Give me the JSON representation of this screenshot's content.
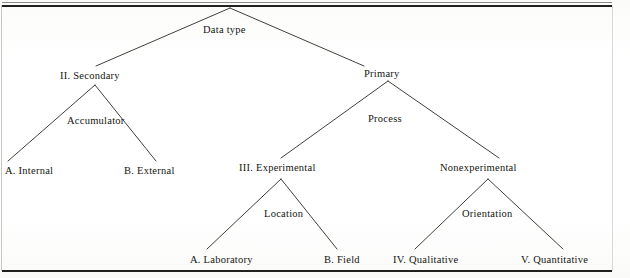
{
  "figure": {
    "width": 630,
    "height": 278,
    "background_color": "#ffffff",
    "ink_color": "#16160f",
    "rule_color": "#20201e"
  },
  "nodes": {
    "root": {
      "label": "Data type",
      "enum": ""
    },
    "secondary": {
      "label": "II.  Secondary",
      "enum": "II."
    },
    "primary": {
      "label": "Primary",
      "enum": ""
    },
    "internal": {
      "label": "A.  Internal",
      "enum": "A."
    },
    "external": {
      "label": "B.  External",
      "enum": "B."
    },
    "experimental": {
      "label": "III.  Experimental",
      "enum": "III."
    },
    "nonexperimental": {
      "label": "Nonexperimental",
      "enum": ""
    },
    "laboratory": {
      "label": "A.  Laboratory",
      "enum": "A."
    },
    "field": {
      "label": "B.  Field",
      "enum": "B."
    },
    "qualitative": {
      "label": "IV.  Qualitative",
      "enum": "IV."
    },
    "quantitative": {
      "label": "V.  Quantitative",
      "enum": "V."
    }
  },
  "branch_criteria": {
    "accumulator": "Accumulator",
    "process": "Process",
    "location": "Location",
    "orientation": "Orientation"
  },
  "tree_structure": {
    "type": "hierarchy",
    "root": "Data type",
    "levels": 4,
    "children": [
      {
        "label": "II.  Secondary",
        "split_criterion": "Accumulator",
        "children": [
          {
            "label": "A.  Internal"
          },
          {
            "label": "B.  External"
          }
        ]
      },
      {
        "label": "Primary",
        "split_criterion": "Process",
        "children": [
          {
            "label": "III.  Experimental",
            "split_criterion": "Location",
            "children": [
              {
                "label": "A.  Laboratory"
              },
              {
                "label": "B.  Field"
              }
            ]
          },
          {
            "label": "Nonexperimental",
            "split_criterion": "Orientation",
            "children": [
              {
                "label": "IV.  Qualitative"
              },
              {
                "label": "V.  Quantitative"
              }
            ]
          }
        ]
      }
    ]
  }
}
